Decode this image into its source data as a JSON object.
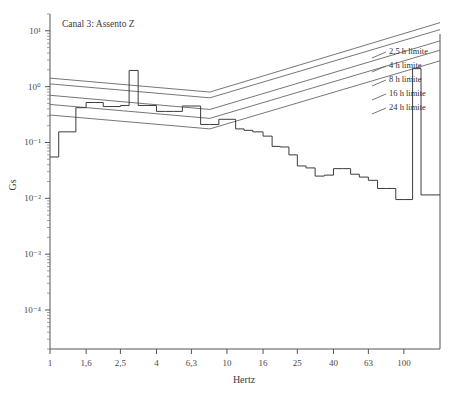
{
  "chart_data": {
    "type": "line",
    "title": "Canal 3: Assento Z",
    "xlabel": "Hertz",
    "ylabel": "Gs",
    "xscale": "log",
    "yscale": "log",
    "xlim": [
      1,
      160
    ],
    "ylim": [
      2e-05,
      20
    ],
    "grid": false,
    "legend_position": "upper-right-inline",
    "xticks": [
      "1",
      "1,6",
      "2,5",
      "4",
      "6,3",
      "10",
      "16",
      "25",
      "40",
      "63",
      "100"
    ],
    "xtick_values": [
      1,
      1.6,
      2.5,
      4,
      6.3,
      10,
      16,
      25,
      40,
      63,
      100
    ],
    "yticks": [
      "10¹",
      "10⁰",
      "10⁻¹",
      "10⁻²",
      "10⁻³",
      "10⁻⁴"
    ],
    "ytick_values": [
      10,
      1,
      0.1,
      0.01,
      0.001,
      0.0001
    ],
    "series": [
      {
        "name": "Canal 3: Assento Z",
        "style": "step",
        "x": [
          1.0,
          1.12,
          1.25,
          1.4,
          1.6,
          1.8,
          2.0,
          2.24,
          2.5,
          2.8,
          3.15,
          3.55,
          4.0,
          4.5,
          5.0,
          5.6,
          6.3,
          7.1,
          8.0,
          9.0,
          10.0,
          11.2,
          12.5,
          14.0,
          16.0,
          18.0,
          20.0,
          22.4,
          25.0,
          28.0,
          31.5,
          35.5,
          40.0,
          45.0,
          50.0,
          56.0,
          63.0,
          71.0,
          80.0,
          90.0,
          100.0,
          112.0,
          125.0,
          140.0
        ],
        "y": [
          0.055,
          0.155,
          0.155,
          0.42,
          0.52,
          0.52,
          0.44,
          0.44,
          0.46,
          1.95,
          0.46,
          0.46,
          0.36,
          0.36,
          0.36,
          0.45,
          0.45,
          0.21,
          0.21,
          0.26,
          0.26,
          0.175,
          0.165,
          0.155,
          0.13,
          0.085,
          0.083,
          0.06,
          0.038,
          0.035,
          0.025,
          0.026,
          0.034,
          0.034,
          0.027,
          0.024,
          0.021,
          0.015,
          0.015,
          0.0095,
          0.0095,
          2.1,
          0.0115,
          0.0115
        ],
        "spike": {
          "x": 112.0,
          "y": 2.1,
          "note": "sharp terminal spike near 110 Hz"
        }
      },
      {
        "name": "2,5 h limite",
        "style": "line",
        "label": "2,5 h limite",
        "x": [
          1.0,
          8.0,
          160.0
        ],
        "y": [
          1.42,
          0.8,
          14.0
        ]
      },
      {
        "name": "4 h limite",
        "style": "line",
        "label": "4 h limite",
        "x": [
          1.0,
          8.0,
          160.0
        ],
        "y": [
          1.12,
          0.63,
          10.5
        ]
      },
      {
        "name": "8 h limite",
        "style": "line",
        "label": "8 h limite",
        "x": [
          1.0,
          8.0,
          160.0
        ],
        "y": [
          0.7,
          0.39,
          6.6
        ]
      },
      {
        "name": "16 h limite",
        "style": "line",
        "label": "16 h limite",
        "x": [
          1.0,
          8.0,
          160.0
        ],
        "y": [
          0.48,
          0.27,
          4.5
        ]
      },
      {
        "name": "24 h limite",
        "style": "line",
        "label": "24 h limite",
        "x": [
          1.0,
          8.0,
          160.0
        ],
        "y": [
          0.31,
          0.175,
          2.9
        ]
      }
    ],
    "legend_entries": [
      "2,5 h limite",
      "4 h limite",
      "8 h limite",
      "16 h limite",
      "24 h limite"
    ]
  }
}
